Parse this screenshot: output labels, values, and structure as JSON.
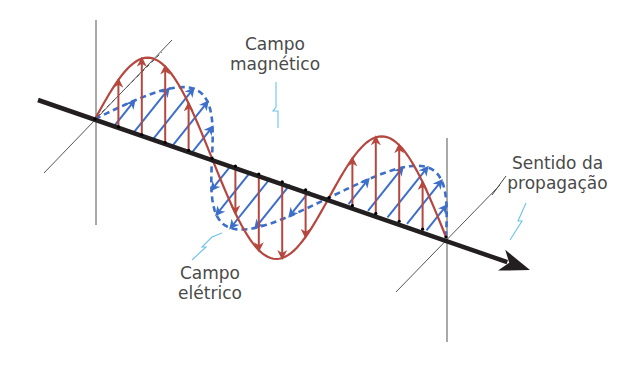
{
  "diagram": {
    "type": "electromagnetic-wave",
    "language": "pt",
    "labels": {
      "magnetic": [
        "Campo",
        "magnético"
      ],
      "electric": [
        "Campo",
        "elétrico"
      ],
      "propagation": [
        "Sentido da",
        "propagação"
      ]
    },
    "colors": {
      "electric_field": "#b5473f",
      "magnetic_field": "#3d6fc9",
      "axis": "#231f20",
      "guide_lines": "#555555",
      "leader_lines": "#6cc3e8",
      "label_text": "#4a4a4a"
    },
    "geometry": {
      "axis_start": [
        38,
        100
      ],
      "axis_origin": [
        95,
        119
      ],
      "axis_end": [
        446,
        237
      ],
      "arrow_tip": [
        530,
        270
      ],
      "wavelengths_shown": 1.5,
      "electric_amplitude_px": 80,
      "magnetic_vector_px": [
        -40,
        50
      ],
      "arrows_per_half_wave": 5
    }
  }
}
